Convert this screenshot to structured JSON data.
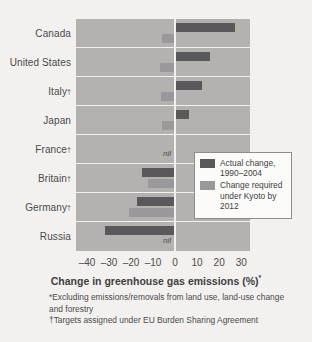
{
  "chart_data": {
    "type": "bar",
    "orientation": "horizontal",
    "title": "",
    "xlabel": "Change in greenhouse gas emissions (%)*",
    "ylabel": "",
    "xlim": [
      -45,
      34
    ],
    "xticks": [
      -40,
      -30,
      -20,
      -10,
      0,
      10,
      20,
      30
    ],
    "xticklabels": [
      "–40",
      "–30",
      "–20",
      "–10",
      "0",
      "10",
      "20",
      "30"
    ],
    "grid": false,
    "legend_position": "inside-right",
    "categories": [
      "Canada",
      "United States",
      "Italy†",
      "Japan",
      "France†",
      "Britain†",
      "Germany†",
      "Russia"
    ],
    "series": [
      {
        "name": "Actual change, 1990–2004",
        "color": "#59585a",
        "values": [
          27.0,
          15.8,
          12.1,
          6.5,
          0.4,
          -14.9,
          -17.2,
          -32.0
        ],
        "labels": [
          "",
          "",
          "",
          "",
          "",
          "",
          "",
          ""
        ]
      },
      {
        "name": "Change required under Kyoto by 2012",
        "color": "#99989a",
        "values": [
          -6.0,
          -7.0,
          -6.5,
          -6.0,
          0,
          -12.5,
          -21.0,
          0
        ],
        "labels": [
          "",
          "",
          "",
          "",
          "nil",
          "",
          "",
          "nil"
        ]
      }
    ],
    "annotations": [
      {
        "text": "nil",
        "row": "France†",
        "series": "Change required under Kyoto by 2012"
      },
      {
        "text": "nil",
        "row": "Russia",
        "series": "Change required under Kyoto by 2012"
      }
    ],
    "footnotes": [
      "*Excluding emissions/removals from land use, land-use change and forestry",
      "†Targets assigned under EU Burden Sharing Agreement"
    ],
    "colors": {
      "actual": "#59585a",
      "kyoto": "#99989a",
      "plot_background": "#b3b2b1",
      "page_background": "#f2f1ef",
      "gridline": "#f2f1ef",
      "text": "#4b4a4c"
    }
  },
  "axis": {
    "title_main": "Change in greenhouse gas emissions (%)",
    "title_sup": "*"
  },
  "legend": {
    "items": [
      {
        "label_line1": "Actual change,",
        "label_line2": "1990–2004"
      },
      {
        "label_line1": "Change required",
        "label_line2": "under Kyoto by",
        "label_line3": "2012"
      }
    ]
  },
  "rows": [
    {
      "name": "Canada",
      "dagger": false
    },
    {
      "name": "United States",
      "dagger": false
    },
    {
      "name": "Italy",
      "dagger": true
    },
    {
      "name": "Japan",
      "dagger": false
    },
    {
      "name": "France",
      "dagger": true
    },
    {
      "name": "Britain",
      "dagger": true
    },
    {
      "name": "Germany",
      "dagger": true
    },
    {
      "name": "Russia",
      "dagger": false
    }
  ],
  "footnotes": {
    "note1": "*Excluding emissions/removals from land use, land-use change and forestry",
    "note2": "†Targets assigned under EU Burden Sharing Agreement"
  },
  "nil_labels": {
    "france": "nil",
    "russia": "nil"
  }
}
